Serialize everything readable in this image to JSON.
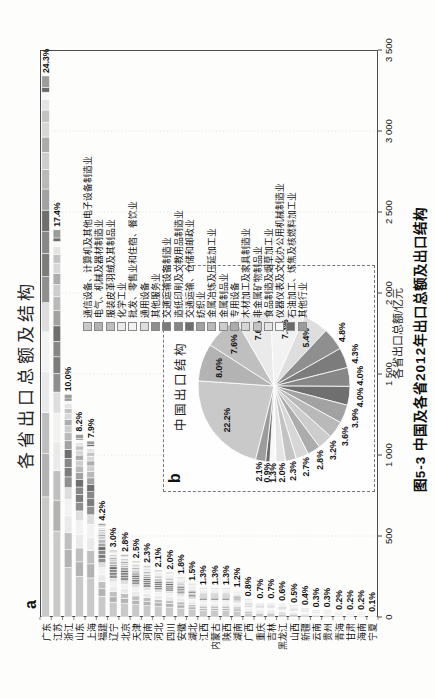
{
  "figure": {
    "title": "各省出口总额及结构",
    "caption": "图5-3 中国及各省2012年出口总额及出口结构",
    "panel_a_label": "a",
    "panel_b_label": "b",
    "pie_title": "中国出口结构",
    "x_axis_label": "各省出口总额/亿元",
    "orientation_note_color": "#1a1a1a"
  },
  "chart_data": [
    {
      "type": "bar",
      "orientation": "horizontal-stacked",
      "title": "各省出口总额及结构",
      "xlabel": "各省出口总额/亿元",
      "xlim": [
        0,
        3500
      ],
      "x_ticks": [
        "0",
        "500",
        "1 000",
        "1 500",
        "2 000",
        "2 500",
        "3 000",
        "3 500"
      ],
      "grid": "light-dotted-vertical",
      "categories": [
        "广东",
        "江苏",
        "浙江",
        "山东",
        "上海",
        "福建",
        "辽宁",
        "北京",
        "天津",
        "河南",
        "河北",
        "四川",
        "安徽",
        "湖北",
        "江西",
        "内蒙古",
        "陕西",
        "湖南",
        "广西",
        "重庆",
        "吉林",
        "黑龙江",
        "山西",
        "新疆",
        "云南",
        "贵州",
        "青海",
        "甘肃",
        "海南",
        "宁夏"
      ],
      "totals_estimated": [
        3340,
        2390,
        1375,
        1127,
        1086,
        577,
        412,
        385,
        344,
        316,
        289,
        275,
        247,
        206,
        179,
        179,
        179,
        165,
        110,
        96,
        96,
        82,
        69,
        55,
        41,
        41,
        27,
        27,
        27,
        14
      ],
      "percent_labels": [
        "24.3%",
        "17.4%",
        "10.0%",
        "8.2%",
        "7.9%",
        "4.2%",
        "3.0%",
        "2.8%",
        "2.5%",
        "2.3%",
        "2.1%",
        "2.0%",
        "1.8%",
        "1.5%",
        "1.3%",
        "1.3%",
        "1.3%",
        "1.2%",
        "0.8%",
        "0.7%",
        "0.7%",
        "0.6%",
        "0.5%",
        "0.4%",
        "0.3%",
        "0.3%",
        "0.2%",
        "0.2%",
        "0.2%",
        "0.1%"
      ],
      "stack_series": [
        "通信设备、计算机及其他电子设备制造业",
        "电气、机械及器材制造业",
        "服装皮革羽绒及其制品业",
        "化学工业",
        "批发、零售业和住宿、餐饮业",
        "通用设备",
        "其他服务业",
        "交通运输设备制造业",
        "造纸印刷及文教用品制造业",
        "交通运输、仓储和邮政业",
        "纺织业",
        "金属冶炼及压延加工业",
        "金属制品业",
        "专用设备",
        "木材加工及家具制造业",
        "非金属矿物制品业",
        "食品制造及烟草加工业",
        "仪器仪表及文化办公用机械制造业",
        "石油加工、炼焦及核燃料加工业",
        "其他行业"
      ]
    },
    {
      "type": "pie",
      "title": "中国出口结构",
      "labels": [
        "通信设备、计算机及其他电子设备制造业",
        "电气、机械及器材制造业",
        "服装皮革羽绒及其制品业",
        "化学工业",
        "批发、零售业和住宿、餐饮业",
        "通用设备",
        "其他服务业",
        "交通运输设备制造业",
        "造纸印刷及文教用品制造业",
        "交通运输、仓储和邮政业",
        "纺织业",
        "金属冶炼及压延加工业",
        "金属制品业",
        "专用设备",
        "木材加工及家具制造业",
        "非金属矿物制品业",
        "食品制造及烟草加工业",
        "仪器仪表及文化办公用机械制造业",
        "石油加工、炼焦及核燃料加工业",
        "其他行业"
      ],
      "values": [
        22.2,
        8.0,
        7.6,
        7.6,
        7.3,
        5.4,
        4.8,
        4.3,
        4.0,
        4.0,
        3.9,
        3.6,
        3.2,
        2.8,
        2.7,
        2.3,
        2.0,
        1.3,
        0.9,
        2.1
      ],
      "percent_labels": [
        "22.2%",
        "8.0%",
        "7.6%",
        "7.6%",
        "7.3%",
        "5.4%",
        "4.8%",
        "4.3%",
        "4.0%",
        "4.0%",
        "3.9%",
        "3.6%",
        "3.2%",
        "2.8%",
        "2.7%",
        "2.3%",
        "2.0%",
        "1.3%",
        "0.9%",
        "2.1%"
      ],
      "colors": [
        "#c9c9c9",
        "#b3b3b3",
        "#bfbfbf",
        "#eaeaea",
        "#f2f2f2",
        "#dedede",
        "#8f8f8f",
        "#7c7c7c",
        "#878787",
        "#6f6f6f",
        "#a2a2a2",
        "#b9b9b9",
        "#cdcdcd",
        "#acacac",
        "#d7d7d7",
        "#c3c3c3",
        "#e4e4e4",
        "#f8f8f8",
        "#6b6b6b",
        "#9c9c9c"
      ],
      "start_angle_deg": 284,
      "direction": "clockwise",
      "legend_position": "right"
    }
  ]
}
